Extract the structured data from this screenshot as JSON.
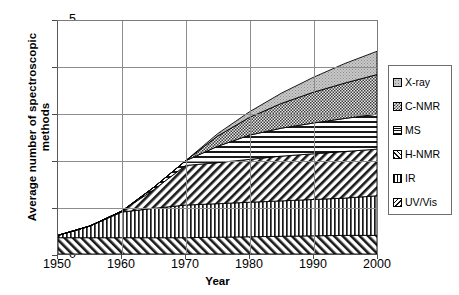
{
  "chart_data": {
    "type": "area",
    "stacked": true,
    "title": "",
    "xlabel": "Year",
    "ylabel": "Average number of spectroscopic methods",
    "ylabel_lines": [
      "Average number of spectroscopic",
      "methods"
    ],
    "x": [
      1950,
      1955,
      1960,
      1965,
      1970,
      1975,
      1980,
      1985,
      1990,
      1995,
      2000
    ],
    "xticks": [
      "1950",
      "1960",
      "1970",
      "1980",
      "1990",
      "2000"
    ],
    "yticks": [
      "0",
      "1",
      "2",
      "3",
      "4",
      "5"
    ],
    "xlim": [
      1950,
      2000
    ],
    "ylim": [
      0,
      5
    ],
    "grid": true,
    "legend_position": "right",
    "series": [
      {
        "name": "UV/Vis",
        "pattern": "diagonal-forward",
        "values": [
          0.35,
          0.35,
          0.35,
          0.35,
          0.35,
          0.36,
          0.37,
          0.38,
          0.39,
          0.4,
          0.4
        ]
      },
      {
        "name": "IR",
        "pattern": "vertical-lines",
        "values": [
          0.05,
          0.25,
          0.55,
          0.63,
          0.7,
          0.72,
          0.74,
          0.76,
          0.78,
          0.8,
          0.85
        ]
      },
      {
        "name": "H-NMR",
        "pattern": "diagonal-back",
        "values": [
          0.0,
          0.0,
          0.02,
          0.4,
          0.85,
          0.88,
          0.92,
          0.96,
          0.98,
          1.0,
          1.0
        ]
      },
      {
        "name": "MS",
        "pattern": "horizontal-lines",
        "values": [
          0.0,
          0.0,
          0.0,
          0.05,
          0.1,
          0.35,
          0.52,
          0.6,
          0.66,
          0.71,
          0.75
        ]
      },
      {
        "name": "C-NMR",
        "pattern": "checker",
        "values": [
          0.0,
          0.0,
          0.0,
          0.0,
          0.0,
          0.22,
          0.38,
          0.53,
          0.66,
          0.76,
          0.85
        ]
      },
      {
        "name": "X-ray",
        "pattern": "light-dots",
        "values": [
          0.0,
          0.0,
          0.0,
          0.0,
          0.0,
          0.05,
          0.12,
          0.22,
          0.32,
          0.42,
          0.5
        ]
      }
    ],
    "cumulative_at_2000": [
      0.4,
      1.25,
      2.25,
      3.0,
      3.85,
      4.35
    ]
  },
  "legend": {
    "items": [
      {
        "label": "X-ray",
        "pattern": "light-dots"
      },
      {
        "label": "C-NMR",
        "pattern": "checker"
      },
      {
        "label": "MS",
        "pattern": "horizontal-lines"
      },
      {
        "label": "H-NMR",
        "pattern": "diagonal-back"
      },
      {
        "label": "IR",
        "pattern": "vertical-lines"
      },
      {
        "label": "UV/Vis",
        "pattern": "diagonal-forward"
      }
    ]
  },
  "colors": {
    "axis": "#4a4a4a",
    "grid": "#8d8d8d",
    "ink": "#000000",
    "background": "#ffffff",
    "xray_fill": "#b5b5b5",
    "cnmr_fill": "#9c9c9c"
  }
}
